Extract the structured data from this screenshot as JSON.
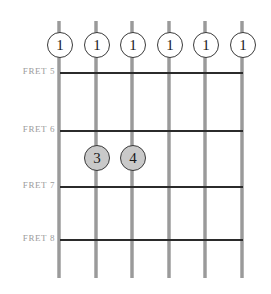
{
  "diagram": {
    "colors": {
      "string": "#9a9a9a",
      "fret_line": "#2b2b2b",
      "fret_label_text": "#9b9b9b",
      "dot_border": "#3a3a3a",
      "dot_fill_open": "#ffffff",
      "dot_fill_filled": "#c9c9c9",
      "dot_text": "#1a1a1a",
      "background": "#ffffff"
    },
    "fret_labels": [
      {
        "label": "FRET 5",
        "y": 72
      },
      {
        "label": "FRET 6",
        "y": 130
      },
      {
        "label": "FRET 7",
        "y": 186
      },
      {
        "label": "FRET 8",
        "y": 239
      }
    ],
    "strings": [
      {
        "name": "string-1",
        "x": 60
      },
      {
        "name": "string-2",
        "x": 97
      },
      {
        "name": "string-3",
        "x": 133
      },
      {
        "name": "string-4",
        "x": 170
      },
      {
        "name": "string-5",
        "x": 206
      },
      {
        "name": "string-6",
        "x": 243
      }
    ],
    "string_top": 21,
    "string_bottom": 278,
    "fret_line_left": 60,
    "fret_line_right": 243,
    "finger_dots": [
      {
        "label": "1",
        "x": 60,
        "y": 45,
        "style": "open",
        "string": 1
      },
      {
        "label": "1",
        "x": 97,
        "y": 45,
        "style": "open",
        "string": 2
      },
      {
        "label": "1",
        "x": 133,
        "y": 45,
        "style": "open",
        "string": 3
      },
      {
        "label": "1",
        "x": 170,
        "y": 45,
        "style": "open",
        "string": 4
      },
      {
        "label": "1",
        "x": 206,
        "y": 45,
        "style": "open",
        "string": 5
      },
      {
        "label": "1",
        "x": 243,
        "y": 45,
        "style": "open",
        "string": 6
      },
      {
        "label": "3",
        "x": 97,
        "y": 158,
        "style": "filled",
        "string": 2
      },
      {
        "label": "4",
        "x": 133,
        "y": 158,
        "style": "filled",
        "string": 3
      }
    ]
  }
}
